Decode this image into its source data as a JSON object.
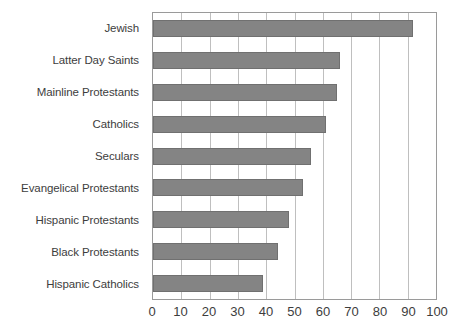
{
  "chart_data": {
    "type": "bar",
    "orientation": "horizontal",
    "title": "",
    "subtitle": "",
    "xlabel": "",
    "ylabel": "",
    "xlim": [
      0,
      100
    ],
    "xticks": [
      0,
      10,
      20,
      30,
      40,
      50,
      60,
      70,
      80,
      90,
      100
    ],
    "xtick_labels": [
      "0",
      "10",
      "20",
      "30",
      "40",
      "50",
      "60",
      "70",
      "80",
      "90",
      "100"
    ],
    "grid": "vertical",
    "legend": "none",
    "categories": [
      "Jewish",
      "Latter Day Saints",
      "Mainline Protestants",
      "Catholics",
      "Seculars",
      "Evangelical Protestants",
      "Hispanic Protestants",
      "Black Protestants",
      "Hispanic Catholics"
    ],
    "values": [
      92,
      66,
      65,
      61,
      56,
      53,
      48,
      44,
      39
    ],
    "bars": [
      {
        "category": "Jewish",
        "value": 92
      },
      {
        "category": "Latter Day Saints",
        "value": 66
      },
      {
        "category": "Mainline Protestants",
        "value": 65
      },
      {
        "category": "Catholics",
        "value": 61
      },
      {
        "category": "Seculars",
        "value": 56
      },
      {
        "category": "Evangelical Protestants",
        "value": 53
      },
      {
        "category": "Hispanic Protestants",
        "value": 48
      },
      {
        "category": "Black Protestants",
        "value": 44
      },
      {
        "category": "Hispanic Catholics",
        "value": 39
      }
    ],
    "colors": {
      "bar_fill": "#848484",
      "bar_border": "#707070",
      "gridline": "#bfbfbf",
      "plot_border": "#9a9a9a",
      "text": "#3d3d3d",
      "background": "#ffffff"
    }
  }
}
